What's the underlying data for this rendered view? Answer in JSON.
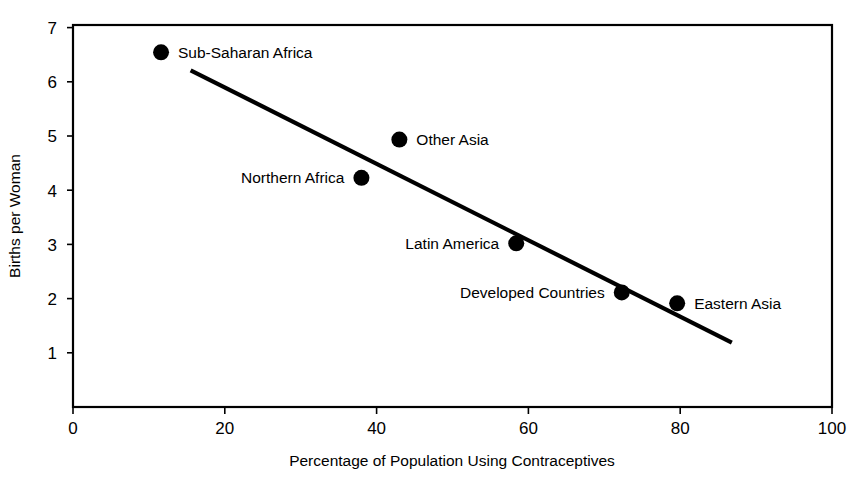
{
  "chart_data": {
    "type": "scatter",
    "title": "",
    "xlabel": "Percentage of Population Using Contraceptives",
    "ylabel": "Births per Woman",
    "xlim": [
      0,
      100
    ],
    "ylim": [
      0,
      7
    ],
    "grid": false,
    "legend": "none",
    "x_ticks": [
      "0",
      "20",
      "40",
      "60",
      "80",
      "100"
    ],
    "x_tick_values": [
      0,
      20,
      40,
      60,
      80,
      100
    ],
    "y_ticks": [
      "1",
      "2",
      "3",
      "4",
      "5",
      "6",
      "7"
    ],
    "y_tick_values": [
      1,
      2,
      3,
      4,
      5,
      6,
      7
    ],
    "points": [
      {
        "label": "Sub-Saharan Africa",
        "x": 11.6,
        "y": 6.5,
        "label_side": "right"
      },
      {
        "label": "Other Asia",
        "x": 43.0,
        "y": 4.9,
        "label_side": "right"
      },
      {
        "label": "Northern Africa",
        "x": 38.0,
        "y": 4.2,
        "label_side": "left"
      },
      {
        "label": "Latin America",
        "x": 58.4,
        "y": 3.0,
        "label_side": "left"
      },
      {
        "label": "Developed Countries",
        "x": 72.3,
        "y": 2.1,
        "label_side": "left"
      },
      {
        "label": "Eastern Asia",
        "x": 79.6,
        "y": 1.9,
        "label_side": "right"
      }
    ],
    "trend_line": {
      "name": "fitted trend line",
      "x_start": 15.5,
      "y_start": 6.17,
      "x_end": 86.8,
      "y_end": 1.18
    },
    "marker": {
      "shape": "filled-circle",
      "color": "#000000",
      "radius_px": 8
    },
    "colors": {
      "axis": "#000000",
      "line": "#000000",
      "marker": "#000000",
      "background": "#ffffff",
      "text": "#000000"
    }
  }
}
